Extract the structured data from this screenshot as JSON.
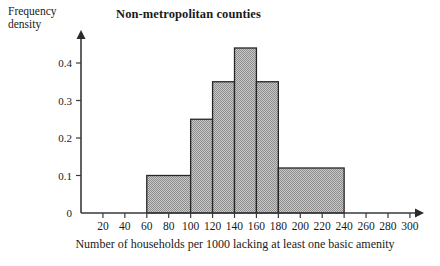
{
  "chart_data": {
    "type": "bar",
    "title": "Non-metropolitan counties",
    "xlabel": "Number of households per 1000 lacking at least one basic amenity",
    "ylabel_line1": "Frequency",
    "ylabel_line2": "density",
    "grid": false,
    "legend": "none",
    "xlim": [
      0,
      310
    ],
    "ylim": [
      0,
      0.47
    ],
    "xticks": [
      20,
      40,
      60,
      80,
      100,
      120,
      140,
      160,
      180,
      200,
      220,
      240,
      260,
      280,
      300
    ],
    "xtick_labels": [
      "20",
      "40",
      "60",
      "80",
      "100",
      "120",
      "140",
      "160",
      "180",
      "200",
      "220",
      "240",
      "260",
      "280",
      "300"
    ],
    "yticks": [
      0,
      0.1,
      0.2,
      0.3,
      0.4
    ],
    "ytick_labels": [
      "0",
      "0.1",
      "0.2",
      "0.3",
      "0.4"
    ],
    "bins": [
      {
        "label": "60-100",
        "x0": 60,
        "x1": 100,
        "value": 0.1
      },
      {
        "label": "100-120",
        "x0": 100,
        "x1": 120,
        "value": 0.25
      },
      {
        "label": "120-140",
        "x0": 120,
        "x1": 140,
        "value": 0.35
      },
      {
        "label": "140-160",
        "x0": 140,
        "x1": 160,
        "value": 0.44
      },
      {
        "label": "160-180",
        "x0": 160,
        "x1": 180,
        "value": 0.35
      },
      {
        "label": "180-240",
        "x0": 180,
        "x1": 240,
        "value": 0.12
      }
    ],
    "bar_fill_color": "#a8a8a8",
    "bar_edge_color": "#262626",
    "axis_color": "#3a3a3a"
  }
}
